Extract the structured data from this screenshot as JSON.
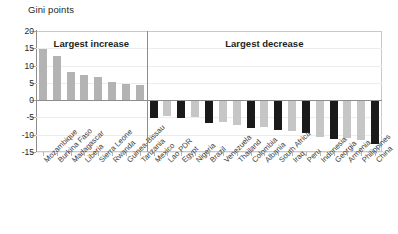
{
  "chart_data": {
    "type": "bar",
    "title": "Gini points",
    "xlabel": "",
    "ylabel": "Gini points",
    "ylim": [
      -15,
      20
    ],
    "yticks": [
      20,
      15,
      10,
      5,
      0,
      -5,
      -10,
      -15
    ],
    "ytick_labels": [
      "20",
      "15",
      "10",
      "5",
      "0",
      "-5",
      "-10",
      "-15"
    ],
    "grid": false,
    "legend_position": "none",
    "panels": [
      {
        "label": "Largest increase",
        "start_index": 0,
        "end_index": 7
      },
      {
        "label": "Largest decrease",
        "start_index": 8,
        "end_index": 24
      }
    ],
    "categories": [
      "Mozambique",
      "Burkina Faso",
      "Madagascar",
      "Liberia",
      "Sierra Leone",
      "Rwanda",
      "Guinea-Bissau",
      "Tanzania",
      "Mexico",
      "Lao PDR",
      "Egypt",
      "Nigeria",
      "Brazil",
      "Venezuela",
      "Thailand",
      "Colombia",
      "Albania",
      "South Africa",
      "Iraq",
      "Peru",
      "Indonesia",
      "Georgia",
      "Armenia",
      "Philippines",
      "China"
    ],
    "values": [
      14.8,
      12.9,
      8.1,
      7.2,
      6.8,
      5.3,
      4.8,
      4.4,
      -5.3,
      -4.7,
      -5.3,
      -5.0,
      -6.7,
      -6.2,
      -7.2,
      -8.0,
      -7.7,
      -8.7,
      -8.9,
      -9.6,
      -10.6,
      -11.3,
      -10.9,
      -11.6,
      -12.7
    ],
    "bar_colors": [
      "#b3b3b3",
      "#b3b3b3",
      "#b3b3b3",
      "#b3b3b3",
      "#b3b3b3",
      "#b3b3b3",
      "#b3b3b3",
      "#b3b3b3",
      "#1a1a1a",
      "#c6c6c6",
      "#1a1a1a",
      "#c6c6c6",
      "#1a1a1a",
      "#c6c6c6",
      "#c6c6c6",
      "#1a1a1a",
      "#c6c6c6",
      "#1a1a1a",
      "#c6c6c6",
      "#1a1a1a",
      "#c6c6c6",
      "#1a1a1a",
      "#c6c6c6",
      "#c6c6c6",
      "#1a1a1a"
    ],
    "colors": {
      "positive_bar": "#b3b3b3",
      "negative_bar_light": "#c6c6c6",
      "negative_bar_dark": "#1a1a1a",
      "axis": "#8d8d8d",
      "frame": "#c9c9c9",
      "text": "#231f20"
    }
  }
}
